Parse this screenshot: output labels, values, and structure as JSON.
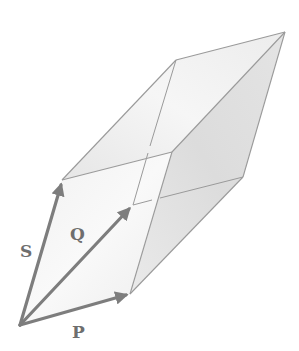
{
  "figure": {
    "colors": {
      "background": "#ffffff",
      "edge": "#9a9a9a",
      "arrow": "#7d7d7d",
      "label": "#6e6e6e",
      "face_light": "#f3f3f3",
      "face_mid": "#ebebeb",
      "face_dark": "#dedede"
    },
    "vectors": [
      {
        "name": "P",
        "label": "P",
        "from": [
          20,
          325
        ],
        "to": [
          130,
          294
        ]
      },
      {
        "name": "Q",
        "label": "Q",
        "from": [
          20,
          325
        ],
        "to": [
          133,
          205
        ]
      },
      {
        "name": "S",
        "label": "S",
        "from": [
          20,
          325
        ],
        "to": [
          62,
          180
        ]
      }
    ],
    "vertices": {
      "O": [
        20,
        325
      ],
      "P": [
        130,
        294
      ],
      "Q": [
        133,
        205
      ],
      "S": [
        62,
        180
      ],
      "S+P": [
        172,
        152
      ],
      "S+Q": [
        176,
        60
      ],
      "P+Q": [
        243,
        177
      ],
      "S+P+Q": [
        285,
        32
      ]
    }
  },
  "labels": {
    "S": "S",
    "Q": "Q",
    "P": "P"
  }
}
